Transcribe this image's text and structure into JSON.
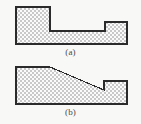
{
  "figure": {
    "background_color": "#f8f8f6",
    "outline_color": "#2b2b2b",
    "hatch_dark_color": "#c9c9c9",
    "hatch_light_color": "#fbfbfb",
    "hatch_pattern": "checkerboard-crosshatch",
    "panels": [
      {
        "id": "a",
        "caption": "(a)",
        "shape_name": "stepped-block-profile",
        "description": "tall block on left, low flat middle, short raised block on right",
        "outline_points": "16,7 50,7 50,31 105,31 105,22 127,22 127,44 16,44",
        "vertices": [
          {
            "x": 16,
            "y": 7
          },
          {
            "x": 50,
            "y": 7
          },
          {
            "x": 50,
            "y": 31
          },
          {
            "x": 105,
            "y": 31
          },
          {
            "x": 105,
            "y": 22
          },
          {
            "x": 127,
            "y": 22
          },
          {
            "x": 127,
            "y": 44
          },
          {
            "x": 16,
            "y": 44
          }
        ]
      },
      {
        "id": "b",
        "caption": "(b)",
        "shape_name": "tapered-block-profile",
        "description": "tall block on left with flat top that tapers down on a slope to a notch, then a short raised block on right",
        "outline_points": "16,67 50,67 104,90 104,81 127,81 127,104 16,104",
        "vertices": [
          {
            "x": 16,
            "y": 67
          },
          {
            "x": 50,
            "y": 67
          },
          {
            "x": 104,
            "y": 90
          },
          {
            "x": 104,
            "y": 81
          },
          {
            "x": 127,
            "y": 81
          },
          {
            "x": 127,
            "y": 104
          },
          {
            "x": 16,
            "y": 104
          }
        ]
      }
    ]
  }
}
